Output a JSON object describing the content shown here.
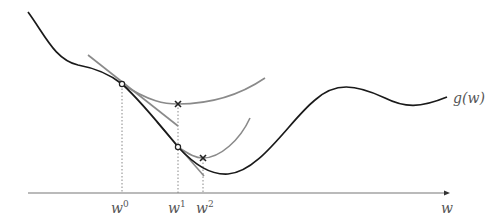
{
  "diagram": {
    "curve_label": "g(w)",
    "axis_label": "w",
    "ticks": [
      {
        "base": "w",
        "sup": "0"
      },
      {
        "base": "w",
        "sup": "1"
      },
      {
        "base": "w",
        "sup": "2"
      }
    ],
    "colors": {
      "curve": "#1a1a1a",
      "approx": "#8a8a8a",
      "axis": "#777777",
      "guide": "#888888"
    }
  }
}
